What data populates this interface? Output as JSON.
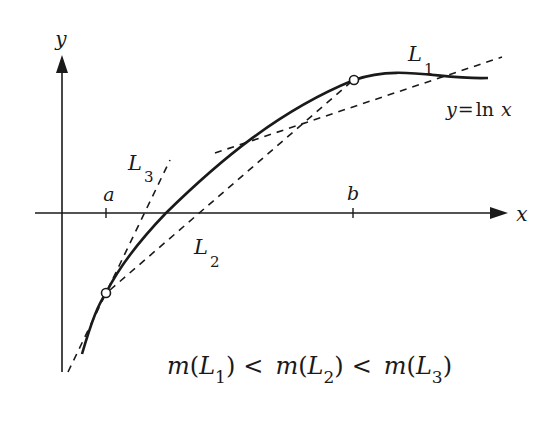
{
  "diagram": {
    "colors": {
      "ink": "#1a1a1a",
      "background": "#ffffff"
    },
    "axes": {
      "x_label": "x",
      "y_label": "y"
    },
    "ticks": {
      "a_label": "a",
      "b_label": "b"
    },
    "curve": {
      "label_lhs": "y",
      "label_eq": "=",
      "label_fn": "ln",
      "label_var": "x"
    },
    "lines": {
      "L1": {
        "letter": "L",
        "sub": "1",
        "desc": "tangent at b"
      },
      "L2": {
        "letter": "L",
        "sub": "2",
        "desc": "secant through a and b"
      },
      "L3": {
        "letter": "L",
        "sub": "3",
        "desc": "tangent at a"
      }
    },
    "formula": {
      "m": "m",
      "open": "(",
      "close": ")",
      "lt": "<",
      "letter": "L",
      "s1": "1",
      "s2": "2",
      "s3": "3"
    }
  }
}
